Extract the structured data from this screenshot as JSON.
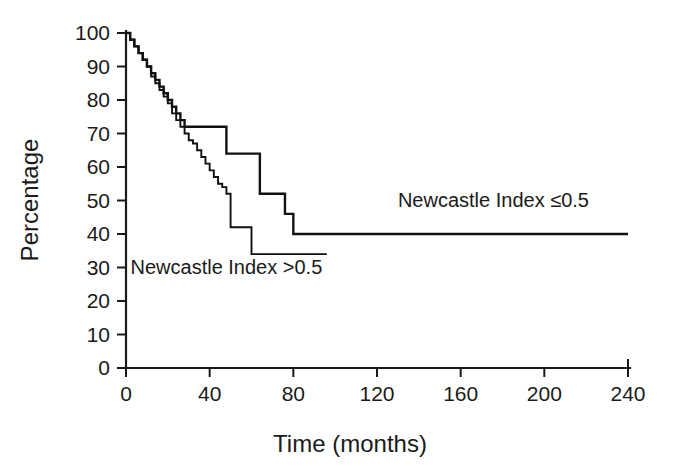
{
  "chart_data": {
    "type": "line",
    "title": "",
    "subtitle": "",
    "xlabel": "Time (months)",
    "ylabel": "Percentage",
    "xlim": [
      0,
      240
    ],
    "ylim": [
      0,
      100
    ],
    "xticks": [
      0,
      40,
      80,
      120,
      160,
      200,
      240
    ],
    "xticklabels": [
      "0",
      "40",
      "80",
      "120",
      "160",
      "200",
      "240"
    ],
    "yticks": [
      0,
      10,
      20,
      30,
      40,
      50,
      60,
      70,
      80,
      90,
      100
    ],
    "yticklabels": [
      "0",
      "10",
      "20",
      "30",
      "40",
      "50",
      "60",
      "70",
      "80",
      "90",
      "100"
    ],
    "grid": false,
    "legend_position": "inline-annotations",
    "step_style": "post",
    "series": [
      {
        "name": "Newcastle Index ≤0.5",
        "label": "Newcastle Index ≤0.5",
        "label_x": 130,
        "label_y": 48,
        "color": "#111111",
        "x": [
          0,
          2,
          4,
          6,
          8,
          10,
          12,
          14,
          16,
          18,
          20,
          22,
          24,
          26,
          28,
          30,
          32,
          34,
          36,
          38,
          40,
          44,
          48,
          50,
          56,
          60,
          64,
          68,
          72,
          76,
          80,
          240
        ],
        "y": [
          100,
          98,
          96,
          94,
          92,
          90,
          88,
          86,
          84,
          82,
          80,
          78,
          76,
          74,
          72,
          72,
          72,
          72,
          72,
          72,
          72,
          72,
          64,
          64,
          64,
          64,
          52,
          52,
          52,
          46,
          40,
          40
        ]
      },
      {
        "name": "Newcastle Index >0.5",
        "label": "Newcastle Index >0.5",
        "label_x": 48,
        "label_y": 28,
        "color": "#111111",
        "x": [
          0,
          2,
          4,
          6,
          8,
          10,
          12,
          14,
          16,
          18,
          20,
          22,
          24,
          26,
          28,
          30,
          32,
          34,
          36,
          38,
          40,
          42,
          44,
          46,
          48,
          50,
          56,
          60,
          96
        ],
        "y": [
          100,
          98,
          96,
          94,
          92,
          90,
          87,
          85,
          83,
          81,
          79,
          76,
          74,
          72,
          70,
          68,
          67,
          65,
          63,
          61,
          59,
          57,
          55,
          54,
          52,
          42,
          42,
          34,
          34
        ]
      }
    ],
    "annotations": [
      {
        "text": "Newcastle Index ≤0.5",
        "x": 130,
        "y": 48
      },
      {
        "text": "Newcastle Index >0.5",
        "x": 48,
        "y": 28
      }
    ]
  },
  "figure": {
    "plot_left_px": 126,
    "plot_right_px": 628,
    "plot_top_px": 33,
    "plot_bottom_px": 368
  }
}
